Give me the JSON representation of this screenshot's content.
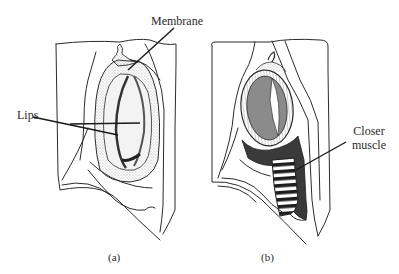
{
  "figure": {
    "panels": [
      {
        "id": "a",
        "caption": "(a)",
        "labels": [
          {
            "text": "Membrane",
            "target": "membrane"
          },
          {
            "text": "Lips",
            "target": "lips"
          }
        ]
      },
      {
        "id": "b",
        "caption": "(b)",
        "labels": [
          {
            "text": "Closer",
            "line2": "muscle",
            "target": "closer-muscle"
          }
        ]
      }
    ]
  },
  "colors": {
    "line": "#2b2b2b",
    "stipple": "#9a9a9a",
    "dark_fill": "#3a3a3a",
    "background": "#ffffff"
  }
}
